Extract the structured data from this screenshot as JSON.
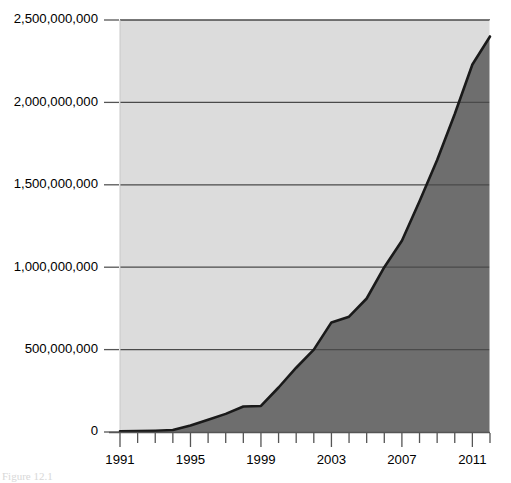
{
  "chart_data": {
    "type": "area",
    "title": "",
    "subtitle": "",
    "xlabel": "",
    "ylabel": "",
    "xlim": [
      1991,
      2012
    ],
    "ylim": [
      0,
      2500000000
    ],
    "grid": true,
    "legend": null,
    "x_tick_labels": [
      "1991",
      "1995",
      "1999",
      "2003",
      "2007",
      "2011"
    ],
    "x_tick_values": [
      1991,
      1995,
      1999,
      2003,
      2007,
      2011
    ],
    "x_minor_tick_values": [
      1991,
      1992,
      1993,
      1994,
      1995,
      1996,
      1997,
      1998,
      1999,
      2000,
      2001,
      2002,
      2003,
      2004,
      2005,
      2006,
      2007,
      2008,
      2009,
      2010,
      2011,
      2012
    ],
    "y_tick_labels": [
      "0",
      "500,000,000",
      "1,000,000,000",
      "1,500,000,000",
      "2,000,000,000",
      "2,500,000,000"
    ],
    "y_tick_values": [
      0,
      500000000,
      1000000000,
      1500000000,
      2000000000,
      2500000000
    ],
    "x": [
      1991,
      1992,
      1993,
      1994,
      1995,
      1996,
      1997,
      1998,
      1999,
      2000,
      2001,
      2002,
      2003,
      2004,
      2005,
      2006,
      2007,
      2008,
      2009,
      2010,
      2011,
      2012
    ],
    "values": [
      5000000,
      6000000,
      8000000,
      12000000,
      40000000,
      75000000,
      110000000,
      155000000,
      158000000,
      270000000,
      390000000,
      500000000,
      665000000,
      700000000,
      810000000,
      1000000000,
      1160000000,
      1400000000,
      1650000000,
      1930000000,
      2230000000,
      2400000000
    ],
    "series_name": "value",
    "area_fill_color": "#6e6e6e",
    "plot_background_color": "#dcdcdc",
    "line_color": "#1a1a1a",
    "gridline_color": "#4a4a4a",
    "page_background_color": "#ffffff"
  },
  "caption": {
    "text": "Figure 12.1"
  }
}
